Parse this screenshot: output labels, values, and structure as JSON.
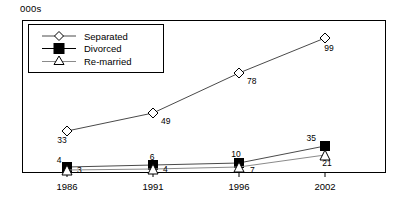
{
  "unit_label": "000s",
  "legend": {
    "items": [
      {
        "label": "Separated",
        "marker": "diamond-open-marker",
        "color": "#000000"
      },
      {
        "label": "Divorced",
        "marker": "square-filled-marker",
        "color": "#000000"
      },
      {
        "label": "Re-married",
        "marker": "triangle-open-marker",
        "color": "#000000"
      }
    ]
  },
  "chart_data": {
    "type": "line",
    "title": "",
    "subtitle": "",
    "xlabel": "",
    "ylabel": "000s",
    "categories": [
      "1986",
      "1991",
      "1996",
      "2002"
    ],
    "series": [
      {
        "name": "Separated",
        "values": [
          33,
          49,
          78,
          99
        ],
        "marker": "diamond-open",
        "color": "#000000"
      },
      {
        "name": "Divorced",
        "values": [
          4,
          6,
          10,
          35
        ],
        "marker": "square-filled",
        "color": "#000000"
      },
      {
        "name": "Re-married",
        "values": [
          3,
          4,
          7,
          21
        ],
        "marker": "triangle-open",
        "color": "#000000"
      }
    ],
    "data_labels": {
      "Separated": [
        "33",
        "49",
        "78",
        "99"
      ],
      "Divorced": [
        "4",
        "6",
        "10",
        "35"
      ],
      "Re-married": [
        "3",
        "4",
        "7",
        "21"
      ]
    },
    "ylim": [
      0,
      110
    ],
    "xlim": [
      "1986",
      "2002"
    ],
    "grid": false,
    "legend_position": "top-left",
    "axis_color": "#000000",
    "frame": true
  },
  "axis": {
    "tick_labels": [
      "1986",
      "1991",
      "1996",
      "2002"
    ]
  }
}
